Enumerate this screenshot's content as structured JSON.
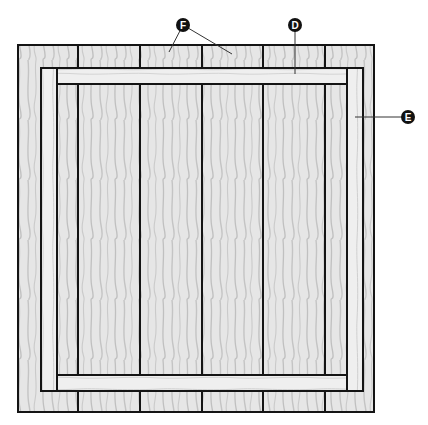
{
  "figure": {
    "type": "woodworking assembly diagram",
    "colors": {
      "wood": "#e6e6e6",
      "wood_light": "#efefef",
      "grain": "#bdbdbd",
      "outline": "#141414",
      "label_fill": "#111111",
      "label_text": "#ffffff",
      "leader": "#333333"
    }
  },
  "boards": {
    "count": 6,
    "items": [
      {
        "x": 18,
        "width": 60
      },
      {
        "x": 78,
        "width": 62
      },
      {
        "x": 140,
        "width": 62
      },
      {
        "x": 202,
        "width": 61
      },
      {
        "x": 263,
        "width": 62
      },
      {
        "x": 325,
        "width": 49
      }
    ],
    "top": 45,
    "bottom": 412
  },
  "frame": {
    "top_rail": {
      "label": "D",
      "x": 57,
      "y": 68,
      "width": 291,
      "height": 16
    },
    "bottom_rail": {
      "x": 57,
      "y": 375,
      "width": 291,
      "height": 16
    },
    "left_stile": {
      "x": 41,
      "y": 68,
      "width": 16,
      "height": 323
    },
    "right_stile": {
      "label": "E",
      "x": 347,
      "y": 68,
      "width": 16,
      "height": 323
    }
  },
  "callouts": [
    {
      "id": "F",
      "text": "F",
      "cx": 183,
      "cy": 25,
      "targets": [
        [
          169,
          52
        ],
        [
          232,
          54
        ]
      ],
      "meaning": "boards"
    },
    {
      "id": "D",
      "text": "D",
      "cx": 295,
      "cy": 25,
      "targets": [
        [
          295,
          73
        ]
      ],
      "meaning": "rail"
    },
    {
      "id": "E",
      "text": "E",
      "cx": 408,
      "cy": 118,
      "targets": [
        [
          355,
          118
        ]
      ],
      "meaning": "stile"
    }
  ]
}
